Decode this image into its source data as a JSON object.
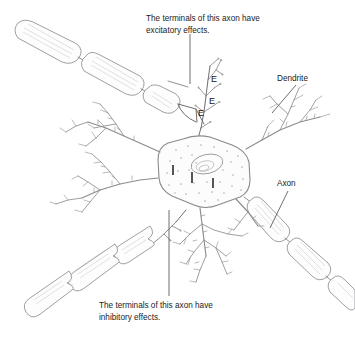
{
  "figure": {
    "width": 355,
    "height": 340,
    "background_color": "#ffffff",
    "line_color": "#8a8a8e",
    "text_color": "#1b1b1b"
  },
  "annotations": {
    "excitatory": {
      "line1": "The terminals of this axon have",
      "line2": "excitatory effects."
    },
    "inhibitory": {
      "line1": "The terminals of this axon have",
      "line2": "inhibitory effects."
    }
  },
  "part_labels": {
    "dendrite": "Dendrite",
    "axon": "Axon"
  },
  "markers": {
    "excitatory_symbol": "E",
    "inhibitory_symbol": "I",
    "excitatory_count": 3,
    "inhibitory_count": 3,
    "excitatory_positions": [
      {
        "x": 211,
        "y": 82
      },
      {
        "x": 209,
        "y": 104
      },
      {
        "x": 198,
        "y": 116
      }
    ]
  }
}
